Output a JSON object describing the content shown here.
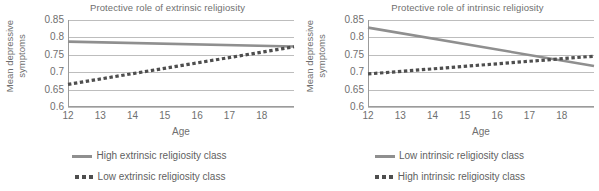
{
  "figure": {
    "panels": [
      {
        "id": "extrinsic",
        "title": "Protective role of extrinsic religiosity",
        "ylabel_line1": "Mean depressive",
        "ylabel_line2": "symptoms",
        "xlabel": "Age",
        "legend": [
          {
            "style": "solid",
            "label": "High extrinsic religiosity class"
          },
          {
            "style": "dotted",
            "label": "Low extrinsic religiosity class"
          }
        ]
      },
      {
        "id": "intrinsic",
        "title": "Protective role of intrinsic religiosity",
        "ylabel_line1": "Mean depressive",
        "ylabel_line2": "symptoms",
        "xlabel": "Age",
        "legend": [
          {
            "style": "solid",
            "label": "Low intrinsic religiosity class"
          },
          {
            "style": "dotted",
            "label": "High intrinsic religiosity class"
          }
        ]
      }
    ],
    "colors": {
      "solid_line": "#8f8f8f",
      "dotted_line": "#4e4e4e",
      "gridline": "#bdbdbd",
      "axis": "#9b9b9b",
      "text": "#6f6f6f"
    }
  },
  "chart_data": [
    {
      "type": "line",
      "title": "Protective role of extrinsic religiosity",
      "xlabel": "Age",
      "ylabel": "Mean depressive symptoms",
      "xlim": [
        12,
        19
      ],
      "ylim": [
        0.6,
        0.85
      ],
      "xticks": [
        12,
        13,
        14,
        15,
        16,
        17,
        18
      ],
      "yticks": [
        0.6,
        0.65,
        0.7,
        0.75,
        0.8,
        0.85
      ],
      "grid": true,
      "legend_position": "below",
      "x": [
        12,
        19
      ],
      "series": [
        {
          "name": "High extrinsic religiosity class",
          "style": "solid",
          "values": [
            0.788,
            0.774
          ]
        },
        {
          "name": "Low extrinsic religiosity class",
          "style": "dotted",
          "values": [
            0.665,
            0.773
          ]
        }
      ]
    },
    {
      "type": "line",
      "title": "Protective role of intrinsic religiosity",
      "xlabel": "Age",
      "ylabel": "Mean depressive symptoms",
      "xlim": [
        12,
        19
      ],
      "ylim": [
        0.6,
        0.85
      ],
      "xticks": [
        12,
        13,
        14,
        15,
        16,
        17,
        18
      ],
      "yticks": [
        0.6,
        0.65,
        0.7,
        0.75,
        0.8,
        0.85
      ],
      "grid": true,
      "legend_position": "below",
      "x": [
        12,
        19
      ],
      "series": [
        {
          "name": "Low intrinsic religiosity class",
          "style": "solid",
          "values": [
            0.828,
            0.718
          ]
        },
        {
          "name": "High intrinsic religiosity class",
          "style": "dotted",
          "values": [
            0.695,
            0.746
          ]
        }
      ]
    }
  ]
}
